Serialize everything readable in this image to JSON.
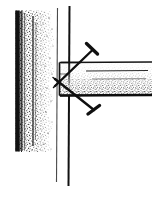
{
  "figure": {
    "caption": "Two nails driven at opposing angles through the end of a horizontal board into a vertical framing member",
    "width": 152,
    "height": 198,
    "background_color": "#ffffff",
    "ink_color": "#111111",
    "line_color": "#1a1a1a",
    "stipple_color": "#1c1c1c",
    "style": "black-and-white stippled pen-and-ink line drawing"
  },
  "wall": {
    "label": "vertical wall framing member",
    "edge_color": "#121212",
    "fill_style": "stipple",
    "x": 15,
    "y": 10,
    "width": 40,
    "height": 142,
    "dark_edge_x": 17,
    "dark_edge_width": 5
  },
  "stud_lines": [
    {
      "name": "stud-line-light",
      "x": 57,
      "y_top": 8,
      "y_bottom": 182,
      "stroke_width": 1.1,
      "color": "#4a4a4a"
    },
    {
      "name": "stud-line-dark",
      "x": 69,
      "y_top": 6,
      "y_bottom": 186,
      "stroke_width": 2.0,
      "color": "#111111"
    }
  ],
  "board": {
    "label": "horizontal board",
    "top_y": 62,
    "bottom_y": 96,
    "left_x": 59,
    "right_x": 152,
    "top_edge_color": "#151515",
    "bottom_edge_color": "#0d0d0d",
    "inner_line_y": 71,
    "inner_line_x1": 86,
    "inner_line_x2": 148,
    "end_outline": {
      "name": "board-end-outline",
      "x": 59,
      "y": 62,
      "width": 22,
      "height": 34
    }
  },
  "nails": [
    {
      "name": "upper-nail",
      "label": "upper toenail driven downward into stud",
      "head_x": 92,
      "head_y": 47,
      "tip_x": 55,
      "tip_y": 86,
      "head_length": 13,
      "shank_width": 2.4,
      "color": "#101010"
    },
    {
      "name": "lower-nail",
      "label": "lower toenail driven upward into stud",
      "head_x": 95,
      "head_y": 113,
      "tip_x": 55,
      "tip_y": 79,
      "head_length": 13,
      "shank_width": 2.4,
      "color": "#101010"
    }
  ],
  "accessibility": {
    "alt_text": "Line drawing of two nails angled in opposite directions through the end of a board into a vertical wall stud, with stipple shading on the wall and board."
  }
}
